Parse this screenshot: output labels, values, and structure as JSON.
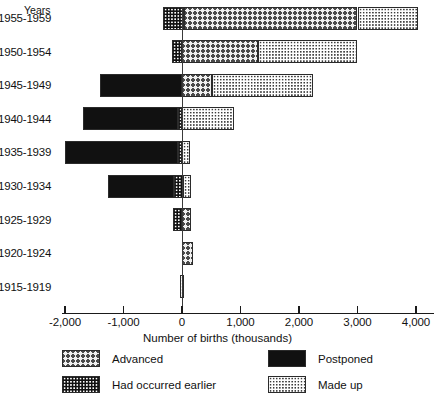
{
  "chart_data": {
    "type": "bar",
    "orientation": "horizontal",
    "title": "",
    "xlabel": "Number of births (thousands)",
    "ylabel": "Years",
    "xlim": [
      -2000,
      4000
    ],
    "xticks": [
      -2000,
      -1000,
      0,
      1000,
      2000,
      3000,
      4000
    ],
    "xticklabels": [
      "-2,000",
      "-1,000",
      "0",
      "1,000",
      "2,000",
      "3,000",
      "4,000"
    ],
    "grid": false,
    "legend_position": "below",
    "zero_reference_line": true,
    "categories": [
      "1955-1959",
      "1950-1954",
      "1945-1949",
      "1940-1944",
      "1935-1939",
      "1930-1934",
      "1925-1929",
      "1920-1924",
      "1915-1919"
    ],
    "series": [
      {
        "name": "Advanced",
        "pattern": "cross-hatch",
        "values": [
          2965,
          1300,
          510,
          0,
          0,
          0,
          155,
          190,
          0
        ]
      },
      {
        "name": "Postponed",
        "pattern": "solid-black",
        "values": [
          0,
          0,
          -1400,
          -1640,
          -1940,
          -1140,
          0,
          0,
          0
        ]
      },
      {
        "name": "Had occurred earlier",
        "pattern": "white-dots-on-black",
        "values": [
          -325,
          -175,
          0,
          -60,
          -60,
          -130,
          -155,
          0,
          0
        ]
      },
      {
        "name": "Made up",
        "pattern": "fine-dots",
        "values": [
          1035,
          1700,
          1730,
          890,
          130,
          140,
          0,
          0,
          70
        ]
      }
    ],
    "bars": [
      {
        "category": "1955-1959",
        "segments": [
          {
            "series": "Had occurred earlier",
            "start": -325,
            "end": 35
          },
          {
            "series": "Advanced",
            "start": 35,
            "end": 3000
          },
          {
            "series": "Made up",
            "start": 3000,
            "end": 4035
          }
        ]
      },
      {
        "category": "1950-1954",
        "segments": [
          {
            "series": "Had occurred earlier",
            "start": -175,
            "end": 0
          },
          {
            "series": "Advanced",
            "start": 0,
            "end": 1300
          },
          {
            "series": "Made up",
            "start": 1300,
            "end": 3000
          }
        ]
      },
      {
        "category": "1945-1949",
        "segments": [
          {
            "series": "Postponed",
            "start": -1400,
            "end": 0
          },
          {
            "series": "Advanced",
            "start": 0,
            "end": 510
          },
          {
            "series": "Made up",
            "start": 510,
            "end": 2240
          }
        ]
      },
      {
        "category": "1940-1944",
        "segments": [
          {
            "series": "Postponed",
            "start": -1700,
            "end": -60
          },
          {
            "series": "Had occurred earlier",
            "start": -60,
            "end": 0
          },
          {
            "series": "Made up",
            "start": 0,
            "end": 890
          }
        ]
      },
      {
        "category": "1935-1939",
        "segments": [
          {
            "series": "Postponed",
            "start": -2000,
            "end": -60
          },
          {
            "series": "Had occurred earlier",
            "start": -60,
            "end": 0
          },
          {
            "series": "Made up",
            "start": 0,
            "end": 130
          }
        ]
      },
      {
        "category": "1930-1934",
        "segments": [
          {
            "series": "Postponed",
            "start": -1270,
            "end": -130
          },
          {
            "series": "Had occurred earlier",
            "start": -130,
            "end": 10
          },
          {
            "series": "Made up",
            "start": 10,
            "end": 150
          }
        ]
      },
      {
        "category": "1925-1929",
        "segments": [
          {
            "series": "Had occurred earlier",
            "start": -155,
            "end": 0
          },
          {
            "series": "Advanced",
            "start": 0,
            "end": 155
          }
        ]
      },
      {
        "category": "1920-1924",
        "segments": [
          {
            "series": "Advanced",
            "start": 0,
            "end": 190
          }
        ]
      },
      {
        "category": "1915-1919",
        "segments": [
          {
            "series": "Made up",
            "start": -30,
            "end": 40
          }
        ]
      }
    ]
  },
  "axis": {
    "years_header": "Years",
    "x_title": "Number of births (thousands)"
  },
  "legend": {
    "items": [
      {
        "label": "Advanced",
        "pattern": "cross-hatch"
      },
      {
        "label": "Postponed",
        "pattern": "solid-black"
      },
      {
        "label": "Had occurred earlier",
        "pattern": "white-dots-on-black"
      },
      {
        "label": "Made up",
        "pattern": "fine-dots"
      }
    ]
  },
  "colors": {
    "ink": "#111111",
    "rule": "#2b2b2b",
    "paper": "#ffffff"
  }
}
